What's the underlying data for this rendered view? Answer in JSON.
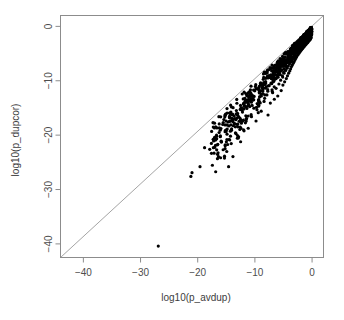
{
  "chart_data": {
    "type": "scatter",
    "title": "",
    "xlabel": "log10(p_avdup)",
    "ylabel": "log10(p_dupcor)",
    "xlim": [
      -44,
      2
    ],
    "ylim": [
      -42.5,
      2
    ],
    "grid": false,
    "legend": null,
    "xticks": [
      -40,
      -30,
      -20,
      -10,
      0
    ],
    "xtick_labels": [
      "-40",
      "-30",
      "-20",
      "-10",
      "0"
    ],
    "yticks": [
      0,
      -10,
      -20,
      -30,
      -40
    ],
    "ytick_labels": [
      "0",
      "-10",
      "-20",
      "-30",
      "-40"
    ],
    "point_color": "#000000",
    "point_size": 1.6,
    "reference_line": {
      "type": "identity",
      "label": "y = x",
      "color": "#9a9a9a",
      "from": [
        -44,
        -42.5
      ],
      "to": [
        2,
        2
      ]
    },
    "annotations": [],
    "n_points": 980,
    "points": [
      [
        -26.9,
        -40.4
      ],
      [
        -21.2,
        -27.6
      ],
      [
        -21.0,
        -26.9
      ],
      [
        -19.6,
        -25.8
      ],
      [
        -18.8,
        -22.3
      ],
      [
        -17.9,
        -22.6
      ],
      [
        -14.6,
        -25.8
      ],
      [
        -15.2,
        -21.8
      ],
      [
        -13.4,
        -19.6
      ],
      [
        -12.5,
        -17.2
      ],
      [
        -11.9,
        -19.2
      ],
      [
        -11.4,
        -15.1
      ],
      [
        -10.6,
        -16.6
      ],
      [
        -10.2,
        -13.5
      ],
      [
        -9.8,
        -17.4
      ],
      [
        -9.6,
        -14.2
      ],
      [
        -9.2,
        -12.1
      ],
      [
        -8.9,
        -15.6
      ],
      [
        -8.6,
        -11.2
      ],
      [
        -8.4,
        -13.8
      ],
      [
        -8.1,
        -10.4
      ],
      [
        -7.9,
        -12.6
      ],
      [
        -7.7,
        -16.3
      ],
      [
        -7.5,
        -10.9
      ],
      [
        -7.3,
        -14.1
      ],
      [
        -7.1,
        -9.6
      ],
      [
        -6.9,
        -12.2
      ],
      [
        -6.8,
        -10.2
      ],
      [
        -6.6,
        -13.4
      ],
      [
        -6.5,
        -8.9
      ],
      [
        -6.3,
        -11.4
      ],
      [
        -6.2,
        -9.4
      ],
      [
        -6.0,
        -12.8
      ],
      [
        -5.9,
        -8.3
      ],
      [
        -5.8,
        -10.6
      ],
      [
        -5.6,
        -7.8
      ],
      [
        -5.5,
        -9.9
      ],
      [
        -5.4,
        -11.8
      ],
      [
        -5.3,
        -7.3
      ],
      [
        -5.2,
        -9.1
      ],
      [
        -5.1,
        -10.8
      ],
      [
        -5.0,
        -6.9
      ],
      [
        -4.9,
        -8.6
      ],
      [
        -4.8,
        -10.2
      ],
      [
        -4.7,
        -6.5
      ],
      [
        -4.6,
        -8.1
      ],
      [
        -4.5,
        -9.6
      ],
      [
        -4.4,
        -6.2
      ],
      [
        -4.35,
        -7.7
      ],
      [
        -4.3,
        -9.1
      ],
      [
        -4.2,
        -5.9
      ],
      [
        -4.15,
        -7.3
      ],
      [
        -4.1,
        -8.6
      ],
      [
        -4.0,
        -5.6
      ],
      [
        -3.95,
        -6.9
      ],
      [
        -3.9,
        -8.2
      ],
      [
        -3.85,
        -5.3
      ],
      [
        -3.8,
        -6.6
      ],
      [
        -3.75,
        -7.8
      ],
      [
        -3.7,
        -5.1
      ],
      [
        -3.65,
        -6.3
      ],
      [
        -3.6,
        -7.4
      ],
      [
        -3.55,
        -4.9
      ],
      [
        -3.5,
        -6.0
      ],
      [
        -3.45,
        -7.1
      ],
      [
        -3.4,
        -4.7
      ],
      [
        -3.35,
        -5.7
      ],
      [
        -3.3,
        -6.8
      ],
      [
        -3.25,
        -4.5
      ],
      [
        -3.2,
        -5.5
      ],
      [
        -3.15,
        -6.5
      ],
      [
        -3.1,
        -4.3
      ],
      [
        -3.05,
        -5.2
      ],
      [
        -3.0,
        -6.2
      ],
      [
        -2.95,
        -4.1
      ],
      [
        -2.9,
        -5.0
      ],
      [
        -2.85,
        -5.9
      ],
      [
        -2.8,
        -3.95
      ],
      [
        -2.75,
        -4.8
      ],
      [
        -2.7,
        -5.6
      ],
      [
        -2.65,
        -3.8
      ],
      [
        -2.6,
        -4.6
      ],
      [
        -2.55,
        -5.3
      ],
      [
        -2.5,
        -3.65
      ],
      [
        -2.45,
        -4.4
      ],
      [
        -2.4,
        -5.1
      ],
      [
        -2.35,
        -3.5
      ],
      [
        -2.3,
        -4.2
      ],
      [
        -2.25,
        -4.9
      ],
      [
        -2.2,
        -3.35
      ],
      [
        -2.15,
        -4.0
      ],
      [
        -2.1,
        -4.65
      ],
      [
        -2.05,
        -3.2
      ],
      [
        -2.0,
        -3.85
      ],
      [
        -1.95,
        -4.45
      ],
      [
        -1.9,
        -3.1
      ],
      [
        -1.85,
        -3.7
      ],
      [
        -1.8,
        -4.25
      ],
      [
        -1.75,
        -2.95
      ],
      [
        -1.7,
        -3.5
      ],
      [
        -1.65,
        -4.05
      ],
      [
        -1.6,
        -2.85
      ],
      [
        -1.55,
        -3.35
      ],
      [
        -1.5,
        -3.85
      ],
      [
        -1.45,
        -2.7
      ],
      [
        -1.4,
        -3.2
      ],
      [
        -1.35,
        -3.65
      ],
      [
        -1.3,
        -2.6
      ],
      [
        -1.25,
        -3.05
      ],
      [
        -1.2,
        -3.45
      ],
      [
        -1.15,
        -2.45
      ],
      [
        -1.1,
        -2.9
      ],
      [
        -1.05,
        -3.3
      ],
      [
        -1.0,
        -2.35
      ],
      [
        -0.95,
        -2.75
      ],
      [
        -0.9,
        -3.1
      ],
      [
        -0.85,
        -2.2
      ],
      [
        -0.8,
        -2.6
      ],
      [
        -0.75,
        -2.95
      ],
      [
        -0.7,
        -2.1
      ],
      [
        -0.65,
        -2.45
      ],
      [
        -0.6,
        -2.75
      ],
      [
        -0.55,
        -1.95
      ],
      [
        -0.5,
        -2.3
      ],
      [
        -0.45,
        -2.55
      ],
      [
        -0.4,
        -1.8
      ],
      [
        -0.35,
        -2.1
      ],
      [
        -0.3,
        -2.35
      ],
      [
        -0.25,
        -1.65
      ],
      [
        -0.2,
        -1.9
      ],
      [
        -0.15,
        -2.1
      ],
      [
        -0.1,
        -1.45
      ],
      [
        -0.08,
        -1.6
      ],
      [
        -0.05,
        -1.2
      ],
      [
        -0.03,
        -0.9
      ],
      [
        -0.01,
        -0.5
      ]
    ]
  },
  "figure": {
    "width": 344,
    "height": 320,
    "background": "#ffffff",
    "axis_color": "#8c8c8c",
    "text_color": "#4d4d4d"
  }
}
